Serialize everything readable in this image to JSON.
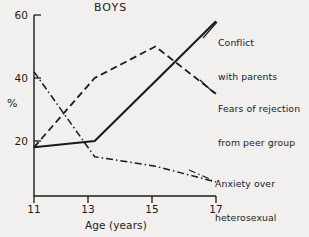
{
  "chart_data": {
    "type": "line",
    "title": "BOYS",
    "xlabel": "Age (years)",
    "ylabel": "%",
    "x": [
      11,
      13,
      15,
      17
    ],
    "xtick_labels": [
      "11",
      "13",
      "15",
      "17"
    ],
    "ytick_labels": [
      "20",
      "40",
      "60"
    ],
    "ytick_values": [
      20,
      40,
      60
    ],
    "xlim": [
      11,
      17
    ],
    "ylim": [
      0,
      60
    ],
    "grid": false,
    "legend_position": "inline-annotations-right",
    "series": [
      {
        "name": "Conflict with parents",
        "label_lines": [
          "Conflict",
          "with parents"
        ],
        "linestyle": "solid",
        "color": "#1b1b1b",
        "values": [
          18,
          20,
          39,
          58
        ]
      },
      {
        "name": "Fears of rejection from peer group",
        "label_lines": [
          "Fears of rejection",
          "from peer group"
        ],
        "linestyle": "dashed",
        "color": "#1b1b1b",
        "values": [
          18,
          40,
          50,
          35
        ]
      },
      {
        "name": "Anxiety over heterosexual relationships",
        "label_lines": [
          "Anxiety over",
          "heterosexual",
          "relationships"
        ],
        "linestyle": "dashdot",
        "color": "#1b1b1b",
        "values": [
          42,
          15,
          12,
          7
        ]
      }
    ]
  },
  "chart": {
    "title": "BOYS",
    "yaxis_title": "%",
    "xaxis_title": "Age (years)",
    "yticks": {
      "t60": "60",
      "t40": "40",
      "t20": "20"
    },
    "xticks": {
      "t11": "11",
      "t13": "13",
      "t15": "15",
      "t17": "17"
    },
    "annotations": {
      "conflict_line1": "Conflict",
      "conflict_line2": "with parents",
      "fears_line1": "Fears of rejection",
      "fears_line2": "from peer group",
      "anxiety_line1": "Anxiety over",
      "anxiety_line2": "heterosexual",
      "anxiety_line3": "relationships"
    }
  }
}
